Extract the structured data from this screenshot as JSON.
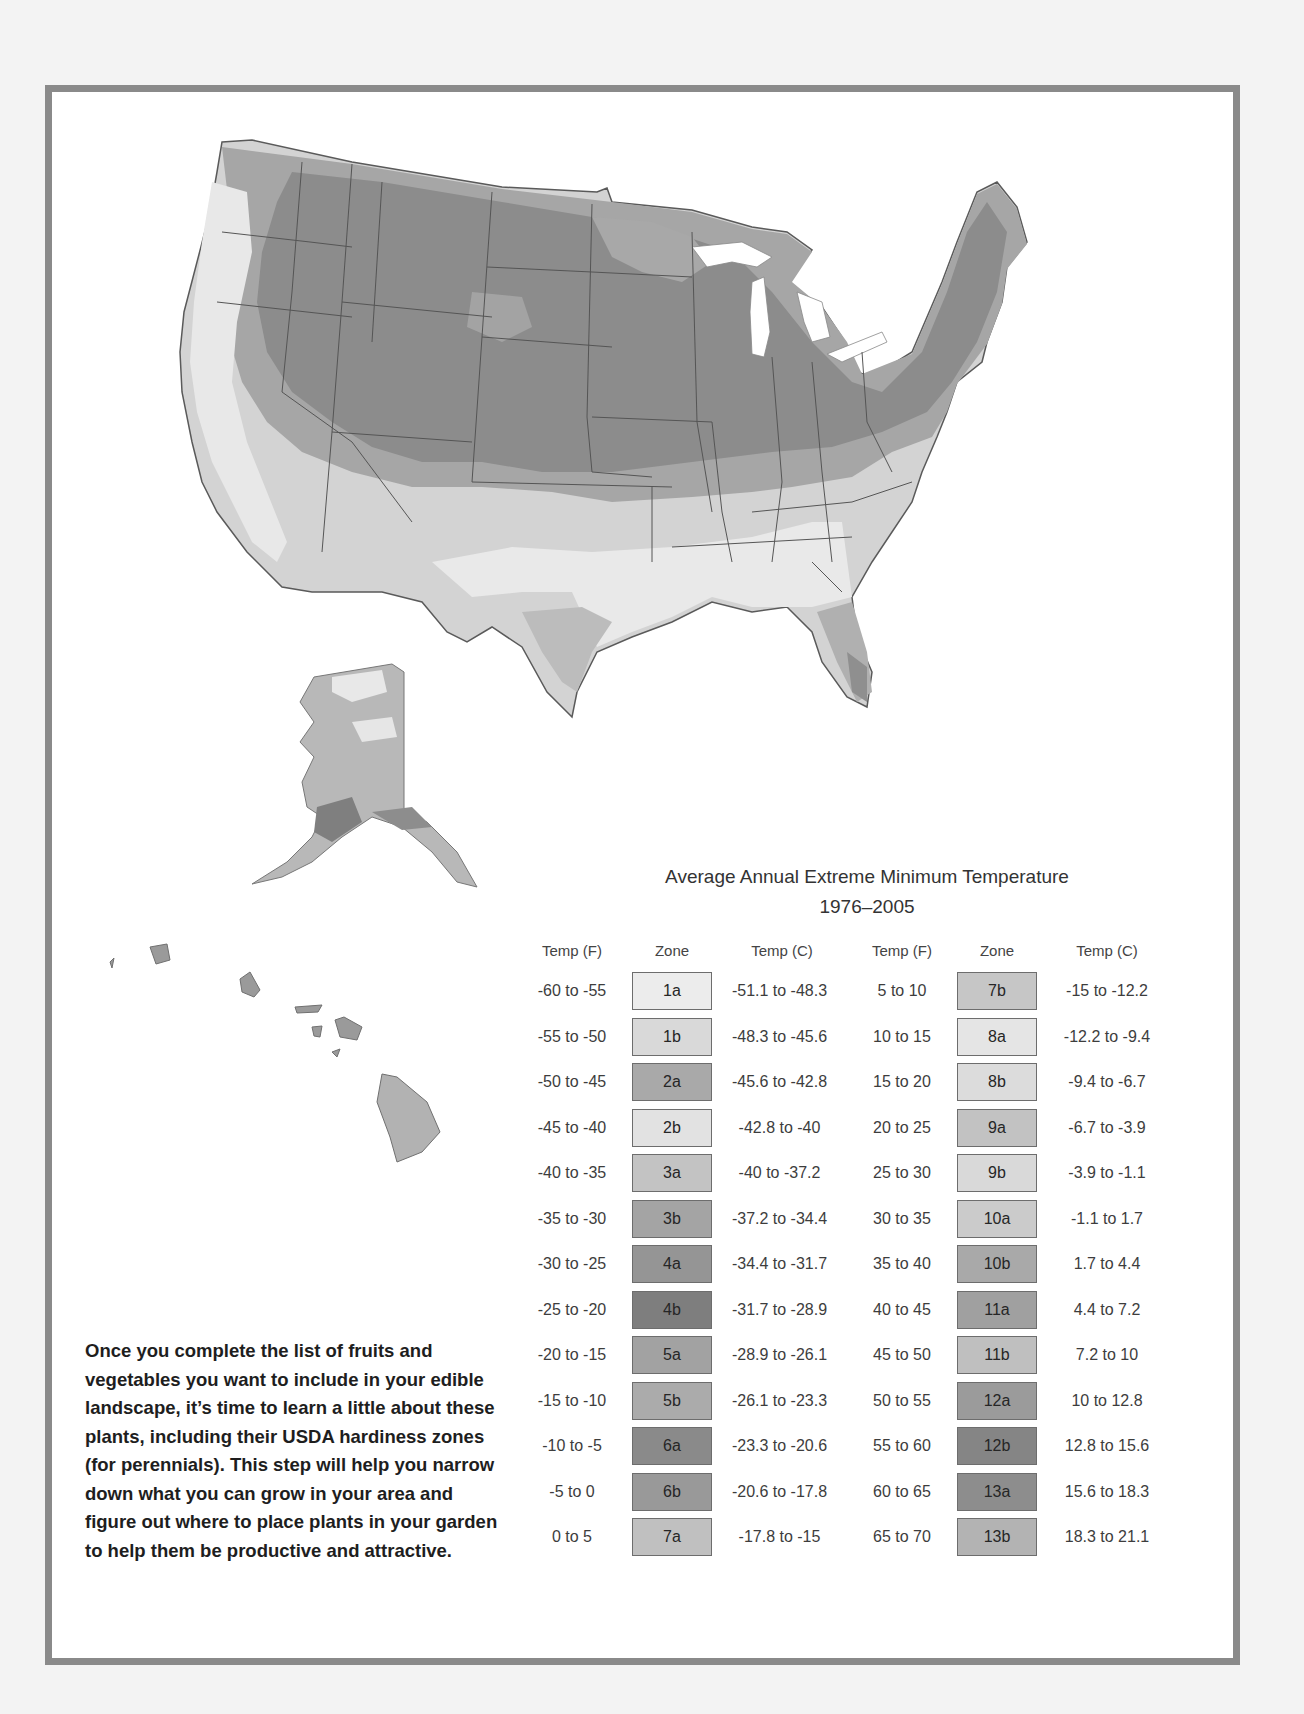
{
  "legend": {
    "title": "Average Annual Extreme Minimum Temperature",
    "period": "1976–2005",
    "headers": {
      "temp_f": "Temp (F)",
      "zone": "Zone",
      "temp_c": "Temp (C)"
    },
    "left_rows": [
      {
        "f": "-60 to -55",
        "zone": "1a",
        "c": "-51.1 to -48.3",
        "color": "#ececec"
      },
      {
        "f": "-55 to -50",
        "zone": "1b",
        "c": "-48.3 to -45.6",
        "color": "#d9d9d9"
      },
      {
        "f": "-50 to -45",
        "zone": "2a",
        "c": "-45.6 to -42.8",
        "color": "#a9a9a9"
      },
      {
        "f": "-45 to -40",
        "zone": "2b",
        "c": "-42.8 to -40",
        "color": "#e2e2e2"
      },
      {
        "f": "-40 to -35",
        "zone": "3a",
        "c": "-40 to -37.2",
        "color": "#c3c3c3"
      },
      {
        "f": "-35 to -30",
        "zone": "3b",
        "c": "-37.2 to -34.4",
        "color": "#a4a4a4"
      },
      {
        "f": "-30 to -25",
        "zone": "4a",
        "c": "-34.4 to -31.7",
        "color": "#959595"
      },
      {
        "f": "-25 to -20",
        "zone": "4b",
        "c": "-31.7 to -28.9",
        "color": "#7e7e7e"
      },
      {
        "f": "-20 to -15",
        "zone": "5a",
        "c": "-28.9 to -26.1",
        "color": "#a2a2a2"
      },
      {
        "f": "-15 to -10",
        "zone": "5b",
        "c": "-26.1 to -23.3",
        "color": "#ababab"
      },
      {
        "f": "-10 to -5",
        "zone": "6a",
        "c": "-23.3 to -20.6",
        "color": "#8a8a8a"
      },
      {
        "f": "-5 to 0",
        "zone": "6b",
        "c": "-20.6 to -17.8",
        "color": "#999999"
      },
      {
        "f": "0 to 5",
        "zone": "7a",
        "c": "-17.8 to -15",
        "color": "#c0c0c0"
      }
    ],
    "right_rows": [
      {
        "f": "5 to 10",
        "zone": "7b",
        "c": "-15 to -12.2",
        "color": "#c6c6c6"
      },
      {
        "f": "10 to 15",
        "zone": "8a",
        "c": "-12.2 to -9.4",
        "color": "#e5e5e5"
      },
      {
        "f": "15 to 20",
        "zone": "8b",
        "c": "-9.4 to -6.7",
        "color": "#dcdcdc"
      },
      {
        "f": "20 to 25",
        "zone": "9a",
        "c": "-6.7 to -3.9",
        "color": "#c2c2c2"
      },
      {
        "f": "25 to 30",
        "zone": "9b",
        "c": "-3.9 to -1.1",
        "color": "#d9d9d9"
      },
      {
        "f": "30 to 35",
        "zone": "10a",
        "c": "-1.1 to 1.7",
        "color": "#cbcbcb"
      },
      {
        "f": "35 to 40",
        "zone": "10b",
        "c": "1.7 to 4.4",
        "color": "#a9a9a9"
      },
      {
        "f": "40 to 45",
        "zone": "11a",
        "c": "4.4 to 7.2",
        "color": "#a0a0a0"
      },
      {
        "f": "45 to 50",
        "zone": "11b",
        "c": "7.2 to 10",
        "color": "#bfbfbf"
      },
      {
        "f": "50 to 55",
        "zone": "12a",
        "c": "10 to 12.8",
        "color": "#9b9b9b"
      },
      {
        "f": "55 to 60",
        "zone": "12b",
        "c": "12.8 to 15.6",
        "color": "#858585"
      },
      {
        "f": "60 to 65",
        "zone": "13a",
        "c": "15.6 to 18.3",
        "color": "#8d8d8d"
      },
      {
        "f": "65 to 70",
        "zone": "13b",
        "c": "18.3 to 21.1",
        "color": "#b3b3b3"
      }
    ]
  },
  "map": {
    "regions": [
      "contiguous-us",
      "alaska",
      "hawaii"
    ],
    "colors": {
      "frame": "#8a8a8a",
      "page_bg": "#f3f3f3",
      "cold_dark": "#8c8c8c",
      "mid": "#a8a8a8",
      "light": "#cfcfcf",
      "very_light": "#e6e6e6",
      "state_line": "#555555"
    }
  },
  "body_text": "Once you complete the list of fruits and vegetables you want to include in your edible landscape, it’s time to learn a little about these plants, including their USDA hardiness zones (for perennials). This step will help you narrow down what you can grow in your area and figure out where to place plants in your garden to help them be productive and attractive."
}
